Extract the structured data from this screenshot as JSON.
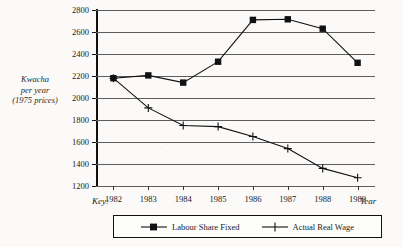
{
  "chart_data": {
    "type": "line",
    "title": "",
    "xlabel": "Year",
    "ylabel": "Kwacha per year (1975 prices)",
    "ylabel_lines": [
      "Kwacha",
      "per year",
      "(1975 prices)"
    ],
    "categories": [
      "1982",
      "1983",
      "1984",
      "1985",
      "1986",
      "1987",
      "1988",
      "1989"
    ],
    "ylim": [
      1200,
      2800
    ],
    "yticks": [
      1200,
      1400,
      1600,
      1800,
      2000,
      2200,
      2400,
      2600,
      2800
    ],
    "ytick_labels": [
      "1200",
      "1400",
      "1600",
      "1800",
      "2000",
      "2200",
      "2400",
      "2600",
      "2800"
    ],
    "grid": "horizontal",
    "legend_position": "bottom",
    "legend_title": "Key:",
    "series": [
      {
        "name": "Labour Share Fixed",
        "marker": "filled-square",
        "color": "#111111",
        "values": [
          2180,
          2205,
          2140,
          2330,
          2710,
          2715,
          2630,
          2320
        ]
      },
      {
        "name": "Actual Real Wage",
        "marker": "plus",
        "color": "#111111",
        "values": [
          2180,
          1910,
          1750,
          1740,
          1650,
          1540,
          1360,
          1275
        ]
      }
    ]
  },
  "labels": {
    "key": "Key:",
    "year": "Year"
  }
}
